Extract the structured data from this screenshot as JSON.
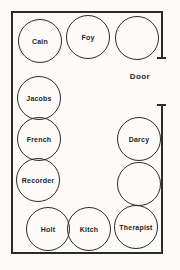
{
  "diagram": {
    "room": {
      "name": "room-outline",
      "door": {
        "label": "Door",
        "wall": "right",
        "gap_top": 57,
        "gap_bottom": 104
      }
    },
    "seats": [
      {
        "id": "seat-cain",
        "label": "Cain",
        "x": 18,
        "y": 19,
        "d": 44,
        "empty": false,
        "group": "top-row"
      },
      {
        "id": "seat-foy",
        "label": "Foy",
        "x": 66,
        "y": 15,
        "d": 44,
        "empty": false,
        "group": "top-row"
      },
      {
        "id": "seat-empty-1",
        "label": "",
        "x": 115,
        "y": 16,
        "d": 44,
        "empty": true,
        "group": "top-row"
      },
      {
        "id": "seat-jacobs",
        "label": "Jacobs",
        "x": 17,
        "y": 76,
        "d": 44,
        "empty": false,
        "group": "left-column"
      },
      {
        "id": "seat-french",
        "label": "French",
        "x": 17,
        "y": 117,
        "d": 44,
        "empty": false,
        "group": "left-column"
      },
      {
        "id": "seat-recorder",
        "label": "Recorder",
        "x": 16,
        "y": 158,
        "d": 44,
        "empty": false,
        "group": "left-column"
      },
      {
        "id": "seat-darcy",
        "label": "Darcy",
        "x": 117,
        "y": 117,
        "d": 44,
        "empty": false,
        "group": "right-column"
      },
      {
        "id": "seat-empty-2",
        "label": "",
        "x": 117,
        "y": 162,
        "d": 44,
        "empty": true,
        "group": "right-column"
      },
      {
        "id": "seat-holt",
        "label": "Holt",
        "x": 26,
        "y": 207,
        "d": 44,
        "empty": false,
        "group": "bottom-row"
      },
      {
        "id": "seat-kitch",
        "label": "Kitch",
        "x": 67,
        "y": 207,
        "d": 44,
        "empty": false,
        "group": "bottom-row"
      },
      {
        "id": "seat-therapist",
        "label": "Therapist",
        "x": 114,
        "y": 205,
        "d": 44,
        "empty": false,
        "group": "bottom-row"
      }
    ]
  }
}
